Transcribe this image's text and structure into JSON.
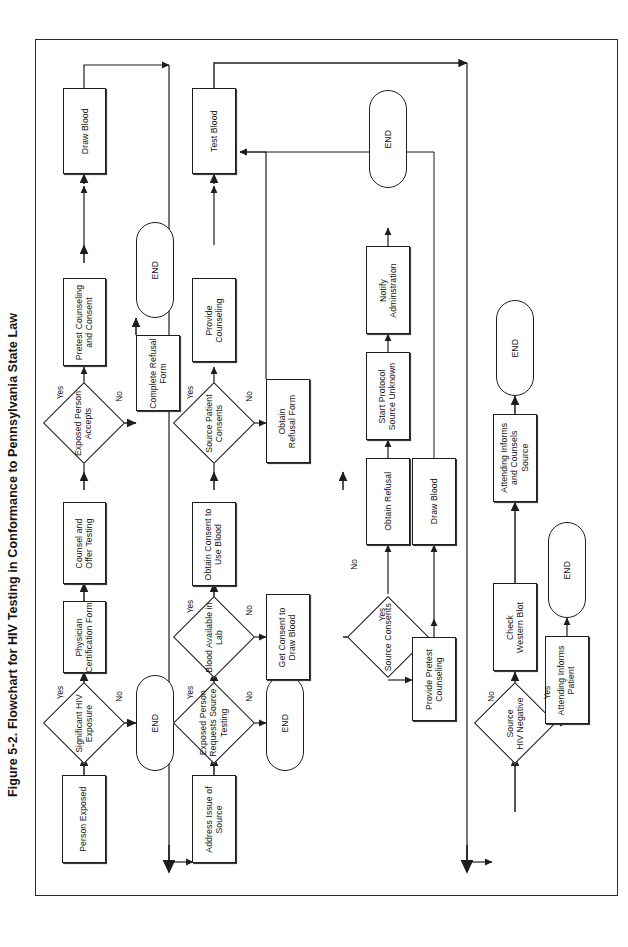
{
  "figure": {
    "caption": "Figure 5-2.  Flowchart for HIV Testing in Conformance to Pennsylvania State Law",
    "orientation": "text rotated 90 degrees counter-clockwise (landscape page)"
  },
  "colors": {
    "ink": "#1d1d1d",
    "paper": "#ffffff",
    "frame": "#2b2b2b"
  },
  "chart_data": {
    "type": "diagram",
    "title": "Flowchart for HIV Testing in Conformance to Pennsylvania State Law",
    "lanes": [
      {
        "name": "exposed-person-lane",
        "start": "Person Exposed"
      },
      {
        "name": "source-patient-lane",
        "start": "Address Issue of Source"
      },
      {
        "name": "source-result-lane",
        "start": "Source HIV Negative"
      }
    ],
    "nodes": [
      {
        "id": "n1",
        "label": "Person Exposed",
        "shape": "process"
      },
      {
        "id": "n2",
        "label": "Significant HIV\nExposure",
        "shape": "decision"
      },
      {
        "id": "n3",
        "label": "END",
        "shape": "terminal"
      },
      {
        "id": "n4",
        "label": "Physician\nCertification Form",
        "shape": "process"
      },
      {
        "id": "n5",
        "label": "Counsel and\nOffer Testing",
        "shape": "process"
      },
      {
        "id": "n6",
        "label": "Exposed Person\nAccepts",
        "shape": "decision"
      },
      {
        "id": "n7",
        "label": "Complete Refusal\nForm",
        "shape": "process"
      },
      {
        "id": "n8",
        "label": "END",
        "shape": "terminal"
      },
      {
        "id": "n9",
        "label": "Pretest Counseling\nand Consent",
        "shape": "process"
      },
      {
        "id": "n10",
        "label": "Draw Blood",
        "shape": "process"
      },
      {
        "id": "m1",
        "label": "Address Issue of\nSource",
        "shape": "process"
      },
      {
        "id": "m2",
        "label": "Exposed Person\nRequests Source\nTesting",
        "shape": "decision"
      },
      {
        "id": "m3",
        "label": "END",
        "shape": "terminal"
      },
      {
        "id": "m4",
        "label": "Blood Available in\nLab",
        "shape": "decision"
      },
      {
        "id": "m5",
        "label": "Get Consent to\nDraw Blood",
        "shape": "process"
      },
      {
        "id": "m6",
        "label": "Obtain Consent to\nUse Blood",
        "shape": "process"
      },
      {
        "id": "m7",
        "label": "Source Patient\nConsents",
        "shape": "decision"
      },
      {
        "id": "m8",
        "label": "Obtain\nRefusal Form",
        "shape": "process"
      },
      {
        "id": "m9",
        "label": "Provide\nCounseling",
        "shape": "process"
      },
      {
        "id": "m10",
        "label": "Test Blood",
        "shape": "process"
      },
      {
        "id": "p1",
        "label": "Source Consents",
        "shape": "decision"
      },
      {
        "id": "p2",
        "label": "Obtain Refusal",
        "shape": "process"
      },
      {
        "id": "p3",
        "label": "Start Protocol\nSource Unknown",
        "shape": "process"
      },
      {
        "id": "p4",
        "label": "Notify\nAdminstration",
        "shape": "process"
      },
      {
        "id": "p5",
        "label": "END",
        "shape": "terminal"
      },
      {
        "id": "p6",
        "label": "Provide Pretest\nCounseling",
        "shape": "process"
      },
      {
        "id": "p7",
        "label": "Draw Blood",
        "shape": "process"
      },
      {
        "id": "q1",
        "label": "Source\nHIV Negative",
        "shape": "decision"
      },
      {
        "id": "q2",
        "label": "Check\nWestern Blot",
        "shape": "process"
      },
      {
        "id": "q3",
        "label": "Attending Informs\nand Counsels\nSource",
        "shape": "process"
      },
      {
        "id": "q4",
        "label": "END",
        "shape": "terminal"
      },
      {
        "id": "q5",
        "label": "Attending Informs\nPatient",
        "shape": "process"
      },
      {
        "id": "q6",
        "label": "END",
        "shape": "terminal"
      }
    ],
    "edges": [
      {
        "from": "n1",
        "to": "n2",
        "label": ""
      },
      {
        "from": "n2",
        "to": "n4",
        "label": "Yes"
      },
      {
        "from": "n2",
        "to": "n3",
        "label": "No"
      },
      {
        "from": "n4",
        "to": "n5",
        "label": ""
      },
      {
        "from": "n5",
        "to": "n6",
        "label": ""
      },
      {
        "from": "n6",
        "to": "n9",
        "label": "Yes"
      },
      {
        "from": "n6",
        "to": "n7",
        "label": "No"
      },
      {
        "from": "n7",
        "to": "n8",
        "label": ""
      },
      {
        "from": "n9",
        "to": "n10",
        "label": ""
      },
      {
        "from": "n10",
        "to": "m1",
        "label": ""
      },
      {
        "from": "m1",
        "to": "m2",
        "label": ""
      },
      {
        "from": "m2",
        "to": "m4",
        "label": "Yes"
      },
      {
        "from": "m2",
        "to": "m3",
        "label": "No"
      },
      {
        "from": "m4",
        "to": "m6",
        "label": "Yes"
      },
      {
        "from": "m4",
        "to": "m5",
        "label": "No"
      },
      {
        "from": "m5",
        "to": "p1",
        "label": ""
      },
      {
        "from": "m6",
        "to": "m7",
        "label": ""
      },
      {
        "from": "m7",
        "to": "m9",
        "label": "Yes"
      },
      {
        "from": "m7",
        "to": "m8",
        "label": "No"
      },
      {
        "from": "m8",
        "to": "m10",
        "label": ""
      },
      {
        "from": "m9",
        "to": "m10",
        "label": ""
      },
      {
        "from": "m10",
        "to": "q1",
        "label": ""
      },
      {
        "from": "p1",
        "to": "p6",
        "label": "Yes"
      },
      {
        "from": "p1",
        "to": "p2",
        "label": "No"
      },
      {
        "from": "p2",
        "to": "p3",
        "label": ""
      },
      {
        "from": "p3",
        "to": "p4",
        "label": ""
      },
      {
        "from": "p4",
        "to": "p5",
        "label": ""
      },
      {
        "from": "p6",
        "to": "p7",
        "label": ""
      },
      {
        "from": "p7",
        "to": "m10",
        "label": ""
      },
      {
        "from": "q1",
        "to": "q2",
        "label": "No"
      },
      {
        "from": "q1",
        "to": "q5",
        "label": "Yes"
      },
      {
        "from": "q2",
        "to": "q3",
        "label": ""
      },
      {
        "from": "q3",
        "to": "q4",
        "label": ""
      },
      {
        "from": "q5",
        "to": "q6",
        "label": ""
      }
    ],
    "edge_labels": [
      "Yes",
      "No"
    ]
  }
}
